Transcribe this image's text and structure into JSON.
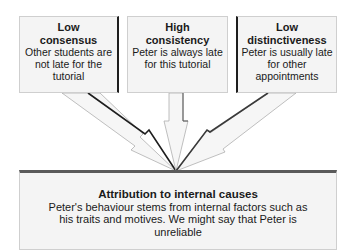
{
  "diagram": {
    "type": "converging-arrows",
    "inputs": [
      {
        "title": "Low consensus",
        "title_lines": [
          "Low",
          "consensus"
        ],
        "text": "Other students are not late for the tutorial"
      },
      {
        "title": "High consistency",
        "title_lines": [
          "High",
          "consistency"
        ],
        "text": "Peter is always late for this tutorial"
      },
      {
        "title": "Low distinctiveness",
        "title_lines": [
          "Low",
          "distinctiveness"
        ],
        "text": "Peter is usually late for other appointments"
      }
    ],
    "output": {
      "title": "Attribution to internal causes",
      "text": "Peter's behaviour stems from internal factors such as his traits and motives. We might say that Peter is unreliable"
    },
    "edges": [
      {
        "from": "Low consensus",
        "to": "Attribution to internal causes"
      },
      {
        "from": "High consistency",
        "to": "Attribution to internal causes"
      },
      {
        "from": "Low distinctiveness",
        "to": "Attribution to internal causes"
      }
    ],
    "colors": {
      "box_fill": "#f4f4f4",
      "box_border": "#cfcfcf",
      "shadow_edge": "#1e1e1e",
      "arrow_fill": "#f6f6f6",
      "arrow_outline": "#9a9a9a",
      "text": "#1a1a1a"
    }
  }
}
